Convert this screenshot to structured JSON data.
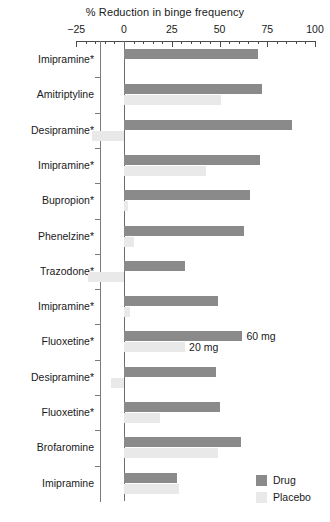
{
  "chart_data": {
    "type": "bar",
    "orientation": "horizontal",
    "title": "% Reduction in binge frequency",
    "xlabel": "% Reduction in binge frequency",
    "ylabel": "",
    "xlim": [
      -25,
      100
    ],
    "xticks": [
      -25,
      0,
      25,
      50,
      75,
      100
    ],
    "xtick_labels": [
      "−25",
      "0",
      "25",
      "50",
      "75",
      "100"
    ],
    "grid": false,
    "legend_position": "bottom-right",
    "zero_reference_line": true,
    "categories": [
      "Imipramine*",
      "Amitriptyline",
      "Desipramine*",
      "Imipramine*",
      "Bupropion*",
      "Phenelzine*",
      "Trazodone*",
      "Imipramine*",
      "Fluoxetine*",
      "Desipramine*",
      "Fluoxetine*",
      "Brofaromine",
      "Imipramine"
    ],
    "series": [
      {
        "name": "Drug",
        "color": "#8a8a8a",
        "values": [
          70,
          72,
          88,
          71,
          66,
          63,
          32,
          49,
          62,
          48,
          50,
          61,
          28
        ]
      },
      {
        "name": "Placebo",
        "color": "#e9e9e9",
        "values": [
          0,
          51,
          -17,
          43,
          2,
          5,
          -19,
          3,
          32,
          -7,
          19,
          49,
          29
        ]
      }
    ],
    "annotations": [
      {
        "text": "60 mg",
        "row": 8,
        "series": "Drug"
      },
      {
        "text": "20 mg",
        "row": 8,
        "series": "Placebo"
      }
    ]
  },
  "legend": {
    "items": [
      {
        "label": "Drug",
        "color": "#8a8a8a"
      },
      {
        "label": "Placebo",
        "color": "#e9e9e9"
      }
    ]
  }
}
